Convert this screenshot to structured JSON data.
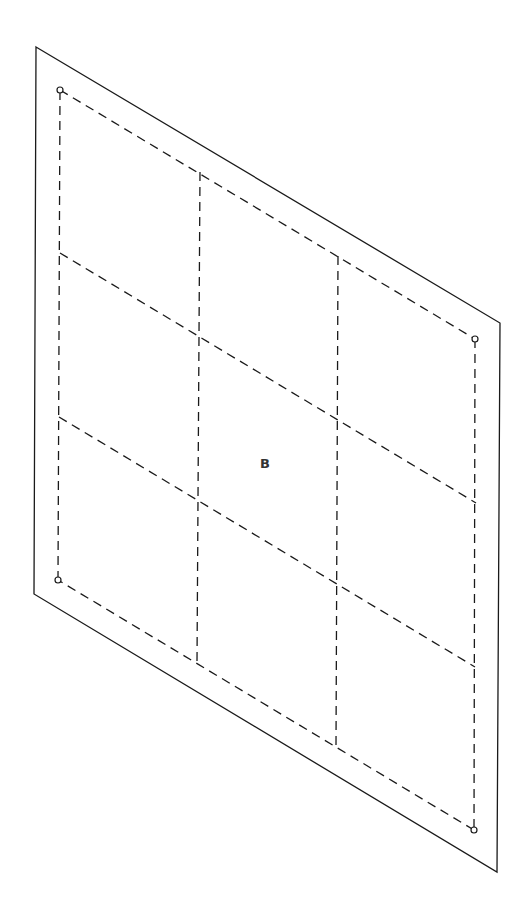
{
  "diagram": {
    "type": "isometric-panel-fold-pattern",
    "panel_label": "B",
    "grid": {
      "rows": 3,
      "columns": 3
    },
    "outline": {
      "top_left": [
        36,
        47
      ],
      "top_right": [
        500,
        323
      ],
      "bottom_right": [
        497,
        872
      ],
      "bottom_left": [
        34,
        594
      ]
    },
    "inner_boundary": {
      "top_left": [
        60,
        90
      ],
      "top_right": [
        475,
        339
      ],
      "bottom_right": [
        474,
        830
      ],
      "bottom_left": [
        58,
        580
      ]
    },
    "corner_holes": [
      {
        "name": "top-left",
        "cx": 60,
        "cy": 90
      },
      {
        "name": "top-right",
        "cx": 475,
        "cy": 339
      },
      {
        "name": "bottom-right",
        "cx": 474,
        "cy": 830
      },
      {
        "name": "bottom-left",
        "cx": 58,
        "cy": 580
      }
    ],
    "vertical_folds": [
      {
        "x1": 200,
        "y1": 172,
        "x2": 197,
        "y2": 663
      },
      {
        "x1": 338,
        "y1": 256,
        "x2": 336,
        "y2": 747
      }
    ],
    "horizontal_folds": [
      {
        "x1": 60,
        "y1": 253,
        "x2": 476,
        "y2": 503
      },
      {
        "x1": 59,
        "y1": 417,
        "x2": 475,
        "y2": 667
      }
    ],
    "colors": {
      "line": "#1a1a1a",
      "label": "#333333",
      "background": "#ffffff"
    }
  }
}
